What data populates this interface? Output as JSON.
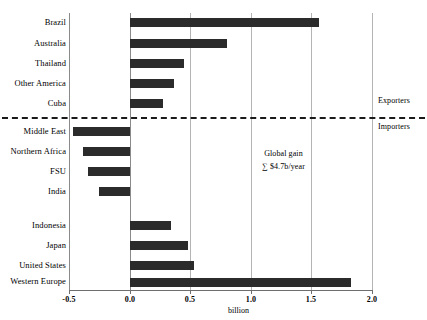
{
  "chart_data": {
    "type": "bar",
    "orientation": "horizontal",
    "title": "",
    "xlabel": "billion",
    "ylabel": "",
    "xlim": [
      -0.5,
      2.0
    ],
    "xticks": [
      -0.5,
      0.0,
      0.5,
      1.0,
      1.5,
      2.0
    ],
    "xtick_labels": [
      "-0.5",
      "0.0",
      "0.5",
      "1.0",
      "1.5",
      "2.0"
    ],
    "grid": true,
    "legend": "none",
    "bar_color": "#2b2b2b",
    "groups": [
      {
        "name": "Exporters",
        "categories": [
          "Brazil",
          "Australia",
          "Thailand",
          "Other America",
          "Cuba"
        ],
        "values": [
          1.56,
          0.8,
          0.45,
          0.36,
          0.27
        ]
      },
      {
        "name": "Importers",
        "categories": [
          "Middle East",
          "Northern Africa",
          "FSU",
          "India"
        ],
        "values": [
          -0.47,
          -0.39,
          -0.35,
          -0.26
        ]
      },
      {
        "name": "Importers (gainers)",
        "categories": [
          "Indonesia",
          "Japan",
          "United States",
          "Western Europe"
        ],
        "values": [
          0.34,
          0.48,
          0.53,
          1.83
        ]
      }
    ],
    "categories": [
      "Brazil",
      "Australia",
      "Thailand",
      "Other America",
      "Cuba",
      "Middle East",
      "Northern Africa",
      "FSU",
      "India",
      "Indonesia",
      "Japan",
      "United States",
      "Western Europe"
    ],
    "values": [
      1.56,
      0.8,
      0.45,
      0.36,
      0.27,
      -0.47,
      -0.39,
      -0.35,
      -0.26,
      0.34,
      0.48,
      0.53,
      1.83
    ],
    "annotations": [
      {
        "text": "Exporters",
        "position": "right-upper"
      },
      {
        "text": "Importers",
        "position": "right-lower"
      },
      {
        "text": "Global gain",
        "position": "center"
      },
      {
        "text": "∑ $4.7b/year",
        "position": "center"
      }
    ],
    "divider": {
      "style": "dashed",
      "at": "between Cuba and Middle East"
    }
  },
  "annotations": {
    "exporters": "Exporters",
    "importers": "Importers",
    "global_gain_line1": "Global gain",
    "global_gain_line2": "∑ $4.7b/year"
  },
  "axis": {
    "x_title": "billion",
    "tick_0": "-0.5",
    "tick_1": "0.0",
    "tick_2": "0.5",
    "tick_3": "1.0",
    "tick_4": "1.5",
    "tick_5": "2.0"
  },
  "labels": {
    "brazil": "Brazil",
    "australia": "Australia",
    "thailand": "Thailand",
    "other_america": "Other America",
    "cuba": "Cuba",
    "middle_east": "Middle East",
    "northern_africa": "Northern Africa",
    "fsu": "FSU",
    "india": "India",
    "indonesia": "Indonesia",
    "japan": "Japan",
    "united_states": "United States",
    "western_europe": "Western Europe"
  },
  "colors": {
    "bar": "#2b2b2b",
    "grid": "#b4b4b4",
    "axis": "#8a8a8a",
    "divider": "#1a1a1a"
  }
}
